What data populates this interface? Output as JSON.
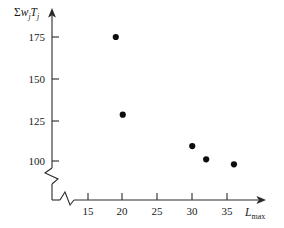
{
  "chart_data": {
    "type": "scatter",
    "title": "",
    "xlabel": "L_max",
    "xlabel_base": "L",
    "xlabel_sub": "max",
    "ylabel": "Σw_j T_j",
    "ylabel_parts": {
      "sigma": "Σ",
      "w": "w",
      "w_sub": "j",
      "t": "T",
      "t_sub": "j"
    },
    "x_ticks": [
      15,
      20,
      25,
      30,
      35
    ],
    "x_tick_labels": [
      "15",
      "20",
      "25",
      "30",
      "35"
    ],
    "y_ticks": [
      100,
      125,
      150,
      175
    ],
    "y_tick_labels": [
      "100",
      "125",
      "150",
      "175"
    ],
    "xlim": [
      12,
      38
    ],
    "ylim": [
      92,
      182
    ],
    "x_axis_break": true,
    "y_axis_break": true,
    "grid": false,
    "legend": false,
    "points": [
      {
        "x": 19,
        "y": 175
      },
      {
        "x": 20,
        "y": 128
      },
      {
        "x": 30,
        "y": 109
      },
      {
        "x": 32,
        "y": 101
      },
      {
        "x": 36,
        "y": 98
      }
    ],
    "marker": "filled-circle",
    "marker_color": "#0d0d0d",
    "axis_color": "#2b2b2b"
  }
}
